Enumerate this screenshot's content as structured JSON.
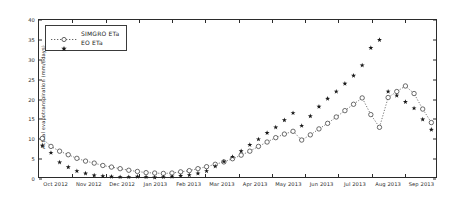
{
  "chart_data": {
    "type": "line",
    "title": "",
    "xlabel": "",
    "ylabel": "Actual evapotranspiration (mm/8days)",
    "ylim": [
      0,
      40
    ],
    "yticks": [
      0,
      5,
      10,
      15,
      20,
      25,
      30,
      35,
      40
    ],
    "grid": false,
    "legend_position": "upper left",
    "xtick_labels": [
      "Oct 2012",
      "Nov 2012",
      "Dec 2012",
      "Jan 2013",
      "Feb 2013",
      "Mar 2013",
      "Apr 2013",
      "May 2013",
      "Jun 2013",
      "Jul 2013",
      "Aug 2013",
      "Sep 2013"
    ],
    "xlim_months": [
      0,
      12
    ],
    "series": [
      {
        "name": "SIMGRO ETa",
        "marker": "open-circle",
        "linestyle": "dotted",
        "color": "#3c3c3c",
        "x": [
          0.1,
          0.36,
          0.62,
          0.88,
          1.14,
          1.4,
          1.66,
          1.92,
          2.18,
          2.44,
          2.7,
          2.96,
          3.22,
          3.48,
          3.74,
          4.0,
          4.26,
          4.52,
          4.78,
          5.04,
          5.3,
          5.56,
          5.82,
          6.08,
          6.34,
          6.6,
          6.86,
          7.12,
          7.38,
          7.64,
          7.9,
          8.16,
          8.42,
          8.68,
          8.94,
          9.2,
          9.46,
          9.72,
          9.98,
          10.24,
          10.5,
          10.76,
          11.02,
          11.28,
          11.54,
          11.8
        ],
        "y": [
          10.2,
          8.2,
          7.0,
          6.1,
          5.2,
          4.5,
          4.0,
          3.4,
          3.0,
          2.6,
          2.2,
          1.9,
          1.6,
          1.5,
          1.4,
          1.5,
          1.8,
          2.1,
          2.6,
          3.1,
          3.7,
          4.3,
          5.1,
          6.0,
          7.0,
          8.2,
          9.3,
          10.4,
          11.3,
          12.0,
          9.8,
          11.1,
          12.6,
          14.0,
          15.6,
          17.2,
          18.8,
          20.4,
          16.2,
          13.0,
          20.5,
          22.0,
          23.4,
          21.5,
          17.6,
          14.2
        ]
      },
      {
        "name": "EO ETa",
        "marker": "star",
        "linestyle": "none",
        "color": "#1a1a1a",
        "x": [
          0.1,
          0.36,
          0.62,
          0.88,
          1.14,
          1.4,
          1.66,
          1.92,
          2.18,
          2.44,
          2.7,
          2.96,
          3.22,
          3.48,
          3.74,
          4.0,
          4.26,
          4.52,
          4.78,
          5.04,
          5.3,
          5.56,
          5.82,
          6.08,
          6.34,
          6.6,
          6.86,
          7.12,
          7.38,
          7.64,
          7.9,
          8.16,
          8.42,
          8.68,
          8.94,
          9.2,
          9.46,
          9.72,
          9.98,
          10.24,
          10.5,
          10.76,
          11.02,
          11.28,
          11.54,
          11.8
        ],
        "y": [
          8.4,
          6.6,
          4.2,
          3.0,
          2.0,
          1.4,
          0.9,
          0.7,
          0.6,
          0.5,
          0.5,
          0.6,
          0.5,
          0.4,
          0.5,
          0.6,
          0.8,
          1.0,
          1.4,
          2.0,
          3.2,
          4.4,
          5.6,
          7.0,
          8.6,
          10.0,
          11.6,
          13.0,
          14.8,
          16.6,
          13.4,
          15.8,
          18.2,
          20.2,
          22.0,
          24.0,
          26.0,
          28.6,
          33.0,
          35.0,
          22.0,
          21.0,
          19.4,
          17.8,
          15.0,
          12.4
        ]
      }
    ]
  },
  "legend": {
    "items": [
      {
        "label": "SIMGRO ETa"
      },
      {
        "label": "EO ETa"
      }
    ]
  },
  "axis": {
    "y_label": "Actual evapotranspiration (mm/8days)"
  }
}
